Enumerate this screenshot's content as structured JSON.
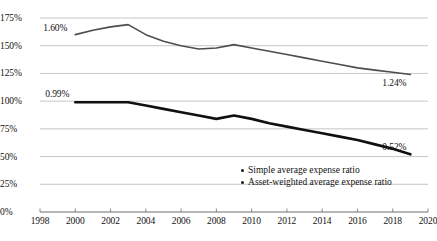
{
  "chart_data": {
    "type": "line",
    "title": "",
    "subtitle": "",
    "xlabel": "",
    "ylabel": "",
    "xlim": [
      1998,
      2020
    ],
    "ylim": [
      0,
      175
    ],
    "xtick_labels": [
      "1998",
      "2000",
      "2002",
      "2004",
      "2006",
      "2008",
      "2010",
      "2012",
      "2014",
      "2016",
      "2018",
      "2020"
    ],
    "xtick_values": [
      1998,
      2000,
      2002,
      2004,
      2006,
      2008,
      2010,
      2012,
      2014,
      2016,
      2018,
      2020
    ],
    "ytick_labels": [
      "0%",
      "25%",
      "50%",
      "75%",
      "100%",
      "125%",
      "150%",
      "175%"
    ],
    "ytick_values": [
      0,
      25,
      50,
      75,
      100,
      125,
      150,
      175
    ],
    "grid": "horizontal",
    "legend_position": "inside-lower-right",
    "x": [
      2000,
      2001,
      2002,
      2003,
      2004,
      2005,
      2006,
      2007,
      2008,
      2009,
      2010,
      2011,
      2012,
      2013,
      2014,
      2015,
      2016,
      2017,
      2018,
      2019
    ],
    "series": [
      {
        "name": "Simple average expense ratio",
        "color": "#4d4d4d",
        "line_width": 1.6,
        "values": [
          160,
          164,
          167,
          169,
          160,
          154,
          150,
          147,
          148,
          151,
          148,
          145,
          142,
          139,
          136,
          133,
          130,
          128,
          126,
          124
        ],
        "start_label": "1.60%",
        "end_label": "1.24%"
      },
      {
        "name": "Asset-weighted average expense ratio",
        "color": "#101010",
        "line_width": 2.6,
        "values": [
          99,
          99,
          99,
          99,
          96,
          93,
          90,
          87,
          84,
          87,
          84,
          80,
          77,
          74,
          71,
          68,
          65,
          61,
          57,
          52
        ],
        "start_label": "0.99%",
        "end_label": "0.52%"
      }
    ],
    "annotations": [
      {
        "name": "simple-start-label",
        "text": "1.60%"
      },
      {
        "name": "simple-end-label",
        "text": "1.24%"
      },
      {
        "name": "weighted-start-label",
        "text": "0.99%"
      },
      {
        "name": "weighted-end-label",
        "text": "0.52%"
      }
    ]
  },
  "legend": {
    "items": [
      {
        "label": "Simple average expense ratio"
      },
      {
        "label": "Asset-weighted average expense ratio"
      }
    ]
  },
  "colors": {
    "background": "#ffffff",
    "grid": "#b8b8b8",
    "axis": "#6f6f6f",
    "text": "#111111",
    "simple_line": "#4d4d4d",
    "weighted_line": "#101010"
  }
}
